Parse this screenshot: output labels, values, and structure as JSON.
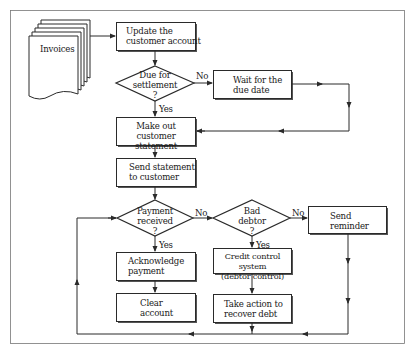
{
  "diagram": {
    "type": "flowchart",
    "colors": {
      "line": "#2a2a2a",
      "box_fill": "#ffffff",
      "background": "#ffffff"
    },
    "nodes": {
      "invoices": {
        "shape": "document-stack",
        "label": "Invoices"
      },
      "update": {
        "shape": "process",
        "line1": "Update the",
        "line2": "customer account"
      },
      "due": {
        "shape": "decision",
        "line1": "Due for",
        "line2": "settlement",
        "line3": "?"
      },
      "wait": {
        "shape": "process",
        "line1": "Wait for the",
        "line2": "due date"
      },
      "make": {
        "shape": "process",
        "line1": "Make out customer",
        "line2": "statement"
      },
      "send_statement": {
        "shape": "process",
        "line1": "Send statement",
        "line2": "to customer"
      },
      "payment": {
        "shape": "decision",
        "line1": "Payment",
        "line2": "received",
        "line3": "?"
      },
      "bad_debtor": {
        "shape": "decision",
        "line1": "Bad",
        "line2": "debtor",
        "line3": "?"
      },
      "reminder": {
        "shape": "process",
        "line1": "Send",
        "line2": "reminder"
      },
      "acknowledge": {
        "shape": "process",
        "line1": "Acknowledge",
        "line2": "payment"
      },
      "clear": {
        "shape": "process",
        "line1": "Clear",
        "line2": "account"
      },
      "credit": {
        "shape": "process",
        "line1": "Credit control system",
        "line2": "(debtor control)"
      },
      "take_action": {
        "shape": "process",
        "line1": "Take action to",
        "line2": "recover debt"
      }
    },
    "edge_labels": {
      "due_no": "No",
      "due_yes": "Yes",
      "payment_no": "No",
      "payment_yes": "Yes",
      "bad_no": "No",
      "bad_yes": "Yes"
    },
    "edges": [
      {
        "from": "invoices",
        "to": "update"
      },
      {
        "from": "update",
        "to": "due"
      },
      {
        "from": "due",
        "to": "wait",
        "label": "No"
      },
      {
        "from": "due",
        "to": "make",
        "label": "Yes"
      },
      {
        "from": "wait",
        "to": "make"
      },
      {
        "from": "make",
        "to": "send_statement"
      },
      {
        "from": "send_statement",
        "to": "payment"
      },
      {
        "from": "payment",
        "to": "acknowledge",
        "label": "Yes"
      },
      {
        "from": "payment",
        "to": "bad_debtor",
        "label": "No"
      },
      {
        "from": "acknowledge",
        "to": "clear"
      },
      {
        "from": "bad_debtor",
        "to": "credit",
        "label": "Yes"
      },
      {
        "from": "bad_debtor",
        "to": "reminder",
        "label": "No"
      },
      {
        "from": "credit",
        "to": "take_action"
      },
      {
        "from": "take_action",
        "to": "payment"
      },
      {
        "from": "reminder",
        "to": "payment"
      }
    ]
  }
}
